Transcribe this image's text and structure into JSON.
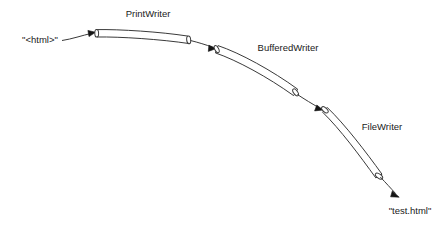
{
  "diagram": {
    "type": "pipeline-flow",
    "background_color": "#ffffff",
    "stroke_color": "#3a3a3a",
    "text_color": "#1a1a1a",
    "source": {
      "label": "\"<html>\"",
      "x": 40,
      "y": 40
    },
    "destination": {
      "label": "\"test.html\"",
      "x": 410,
      "y": 211
    },
    "pipes": [
      {
        "label": "PrintWriter",
        "label_x": 148,
        "label_y": 13,
        "start_x": 96,
        "start_y": 30,
        "end_x": 188,
        "end_y": 40
      },
      {
        "label": "BufferedWriter",
        "label_x": 288,
        "label_y": 48,
        "start_x": 216,
        "start_y": 49,
        "end_x": 300,
        "end_y": 93
      },
      {
        "label": "FileWriter",
        "label_x": 382,
        "label_y": 126,
        "start_x": 325,
        "start_y": 110,
        "end_x": 381,
        "end_y": 177
      }
    ],
    "connectors": [
      {
        "from": "source",
        "to": "pipe-printwriter",
        "arrow": true
      },
      {
        "from": "pipe-printwriter",
        "to": "pipe-bufferedwriter",
        "arrow": true
      },
      {
        "from": "pipe-bufferedwriter",
        "to": "pipe-filewriter",
        "arrow": true
      },
      {
        "from": "pipe-filewriter",
        "to": "destination",
        "arrow": true
      }
    ]
  }
}
